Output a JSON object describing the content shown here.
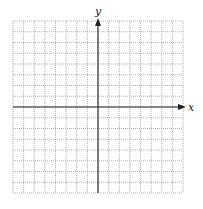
{
  "diagram": {
    "type": "coordinate-plane",
    "x_axis_label": "x",
    "y_axis_label": "y",
    "grid": {
      "columns": 16,
      "rows": 16,
      "left": 13,
      "top": 21,
      "cell_width": 10.625,
      "cell_height": 10.75,
      "line_style": "dotted",
      "line_color": "#9a9a9a",
      "border_color": "#b0b0b0"
    },
    "axes": {
      "color": "#222222",
      "origin_col": 8,
      "origin_row": 8,
      "x_arrow": "positive-only",
      "y_arrow": "positive-only"
    }
  }
}
